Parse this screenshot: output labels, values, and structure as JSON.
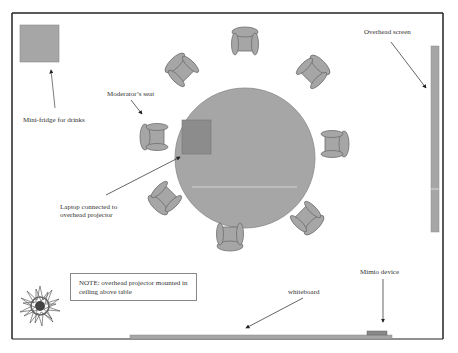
{
  "diagram": {
    "title": "",
    "colors": {
      "room_border": "#222222",
      "furniture_fill": "#a6a6a6",
      "furniture_stroke": "#6e6e6e",
      "laptop_fill": "#8c8c8c",
      "text": "#333333"
    },
    "labels": {
      "mini_fridge": "Mini-fridge for drinks",
      "moderator_seat": "Moderator’s seat",
      "laptop_line1": "Laptop connected to",
      "laptop_line2": "overhead projector",
      "overhead_screen": "Overhead screen",
      "mimio": "Mimio device",
      "whiteboard": "whiteboard",
      "note_line1": "NOTE: overhead projector mounted in",
      "note_line2": "ceiling above table"
    },
    "objects": [
      {
        "name": "mini-fridge",
        "shape": "square"
      },
      {
        "name": "round-table",
        "shape": "circle"
      },
      {
        "name": "laptop",
        "shape": "square"
      },
      {
        "name": "chair",
        "count": 8
      },
      {
        "name": "overhead-screen",
        "shape": "vertical-bar"
      },
      {
        "name": "whiteboard",
        "shape": "horizontal-bar"
      },
      {
        "name": "mimio-device",
        "shape": "small-rect"
      },
      {
        "name": "plant",
        "shape": "starburst"
      }
    ]
  }
}
